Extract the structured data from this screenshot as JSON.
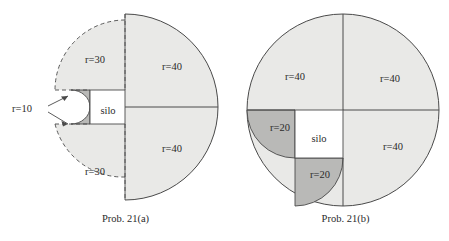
{
  "figures": [
    {
      "id": "fig-a",
      "caption": "Prob. 21(a)",
      "labels": {
        "upper_left": "r=30",
        "lower_left": "r=30",
        "upper_right": "r=40",
        "lower_right": "r=40",
        "silo": "silo",
        "small_radius": "r=10"
      }
    },
    {
      "id": "fig-b",
      "caption": "Prob. 21(b)",
      "labels": {
        "upper_left": "r=40",
        "upper_right": "r=40",
        "lower_right": "r=40",
        "silo": "silo",
        "left_small": "r=20",
        "bottom_small": "r=20"
      }
    }
  ],
  "colors": {
    "light_fill": "#e9e9e7",
    "dark_fill": "#b9b9b7",
    "white_fill": "#ffffff",
    "stroke": "#4a4a4a",
    "text": "#2b2b2b"
  }
}
